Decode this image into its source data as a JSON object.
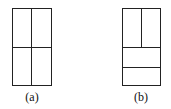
{
  "figures": [
    {
      "label": "(a)",
      "description": "rectangle divided into four equal quadrants"
    },
    {
      "label": "(b)",
      "description": "rectangle with top half split vertically and bottom half split into two horizontal strips"
    }
  ]
}
